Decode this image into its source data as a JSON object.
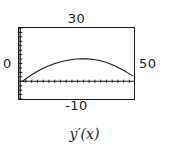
{
  "figure": {
    "caption": "y′(x)",
    "axis_color": "#1a1a1a",
    "curve_color": "#1a1a1a",
    "background": "#ffffff"
  },
  "window": {
    "ymax_label": "30",
    "ymin_label": "-10",
    "xmin_label": "0",
    "xmax_label": "50"
  },
  "chart_data": {
    "type": "line",
    "title": "",
    "subtitle": "",
    "xlabel": "",
    "ylabel": "",
    "caption": "y′(x)",
    "xlim": [
      0,
      50
    ],
    "ylim": [
      -10,
      30
    ],
    "grid": false,
    "legend": null,
    "axis_ticks": {
      "x_axis_drawn_at_y": 0,
      "y_axis_drawn_at_x": 0,
      "x_tick_spacing": 2.5,
      "y_tick_spacing": 2.5
    },
    "series": [
      {
        "name": "y'(x)",
        "x": [
          1.6,
          3,
          5,
          7.5,
          10,
          12.5,
          15,
          17.5,
          20,
          22.5,
          25,
          27.5,
          30,
          32.5,
          35,
          37.5,
          40,
          42.5,
          45,
          47.5,
          49.5
        ],
        "y": [
          0,
          1.4,
          3.2,
          5.2,
          7.0,
          8.5,
          9.7,
          10.7,
          11.5,
          12.1,
          12.5,
          12.7,
          12.6,
          12.3,
          11.7,
          10.8,
          9.6,
          8.2,
          6.5,
          4.6,
          3.0
        ]
      }
    ],
    "annotations": [
      {
        "text": "30",
        "position": "above-plot-center",
        "meaning": "y-axis maximum"
      },
      {
        "text": "-10",
        "position": "below-plot-center",
        "meaning": "y-axis minimum"
      },
      {
        "text": "0",
        "position": "left-of-plot",
        "meaning": "x-axis minimum"
      },
      {
        "text": "50",
        "position": "right-of-plot",
        "meaning": "x-axis maximum"
      }
    ]
  }
}
